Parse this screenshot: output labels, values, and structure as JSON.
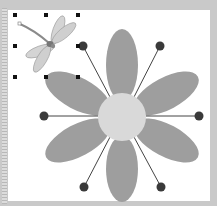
{
  "document": {
    "type": "drawing-canvas",
    "background_color": "#c9c9c9",
    "canvas_color": "#ffffff"
  },
  "objects": {
    "clipart": {
      "name": "dragonfly",
      "selected": true,
      "handle_positions": [
        [
          15,
          15
        ],
        [
          46,
          15
        ],
        [
          78,
          15
        ],
        [
          15,
          46
        ],
        [
          78,
          46
        ],
        [
          15,
          77
        ],
        [
          46,
          77
        ],
        [
          78,
          77
        ]
      ]
    },
    "flower": {
      "center": [
        122,
        117
      ],
      "center_radius": 24,
      "center_color": "#d9d9d9",
      "petal_color": "#9e9e9e",
      "petal_count": 8,
      "spoke_color": "#444444",
      "dot_color": "#3a3a3a",
      "dots": [
        [
          83,
          46
        ],
        [
          160,
          46
        ],
        [
          44,
          116
        ],
        [
          199,
          116
        ],
        [
          84,
          187
        ],
        [
          161,
          187
        ]
      ]
    }
  }
}
